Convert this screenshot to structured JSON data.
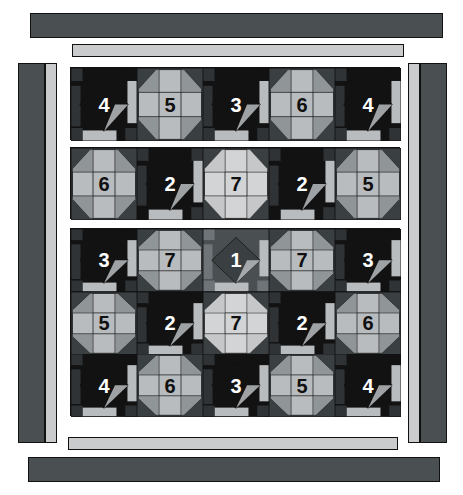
{
  "image": {
    "kind": "quilt-pattern-diagram",
    "width": 463,
    "height": 495,
    "background": "#ffffff"
  },
  "palette": {
    "dark_navy": "#2f3336",
    "black": "#121212",
    "charcoal": "#3a3f42",
    "mid_gray": "#6f7478",
    "light_gray": "#b9bcbe",
    "pale_gray": "#d2d4d5",
    "white_ish": "#e9eaea",
    "outline": "#111111",
    "number_light": "#ffffff",
    "number_dark": "#101010"
  },
  "borders": {
    "top_outer": {
      "name": "top-outer-border-bar",
      "x": 30,
      "y": 13,
      "w": 413,
      "h": 25,
      "fill": "#4a4f52"
    },
    "top_inner": {
      "name": "top-inner-border-bar",
      "x": 72,
      "y": 44,
      "w": 332,
      "h": 13,
      "fill": "#c9cbcc"
    },
    "bottom_inner": {
      "name": "bottom-inner-border-bar",
      "x": 68,
      "y": 437,
      "w": 330,
      "h": 13,
      "fill": "#c9cbcc"
    },
    "bottom_outer": {
      "name": "bottom-outer-border-bar",
      "x": 28,
      "y": 457,
      "w": 412,
      "h": 25,
      "fill": "#4a4f52"
    },
    "left_outer": {
      "name": "left-outer-border-bar",
      "x": 18,
      "y": 63,
      "w": 27,
      "h": 380,
      "fill": "#4a4f52"
    },
    "left_inner": {
      "name": "left-inner-border-bar",
      "x": 45,
      "y": 63,
      "w": 12,
      "h": 380,
      "fill": "#c9cbcc"
    },
    "right_inner": {
      "name": "right-inner-border-bar",
      "x": 408,
      "y": 63,
      "w": 12,
      "h": 380,
      "fill": "#c9cbcc"
    },
    "right_outer": {
      "name": "right-outer-border-bar",
      "x": 420,
      "y": 63,
      "w": 27,
      "h": 380,
      "fill": "#4a4f52"
    }
  },
  "panel": {
    "x": 68,
    "y": 63,
    "w": 334,
    "h": 370
  },
  "sections": [
    {
      "name": "quilt-section-top",
      "x": 70,
      "y": 67,
      "w": 330,
      "h": 73,
      "cols": 5,
      "rows": 1
    },
    {
      "name": "quilt-section-middle",
      "x": 70,
      "y": 147,
      "w": 330,
      "h": 72,
      "cols": 5,
      "rows": 1
    },
    {
      "name": "quilt-section-bottom",
      "x": 70,
      "y": 228,
      "w": 330,
      "h": 188,
      "cols": 5,
      "rows": 3
    }
  ],
  "blocks": {
    "section_top": [
      {
        "label": "4",
        "style": "snowball-dark",
        "bg": "#121212",
        "center": "#121212",
        "ring": "#2f3336",
        "accent": "#b9bcbe",
        "num_color": "#ffffff"
      },
      {
        "label": "5",
        "style": "octagon-light",
        "bg": "#3a3f42",
        "center": "#b9bcbe",
        "ring": "#b9bcbe",
        "accent": "#6f7478",
        "num_color": "#101010"
      },
      {
        "label": "3",
        "style": "snowball-dark",
        "bg": "#121212",
        "center": "#121212",
        "ring": "#2f3336",
        "accent": "#b9bcbe",
        "num_color": "#ffffff"
      },
      {
        "label": "6",
        "style": "octagon-light",
        "bg": "#3a3f42",
        "center": "#b9bcbe",
        "ring": "#b9bcbe",
        "accent": "#6f7478",
        "num_color": "#101010"
      },
      {
        "label": "4",
        "style": "snowball-dark",
        "bg": "#121212",
        "center": "#121212",
        "ring": "#2f3336",
        "accent": "#b9bcbe",
        "num_color": "#ffffff"
      }
    ],
    "section_middle": [
      {
        "label": "6",
        "style": "octagon-light",
        "bg": "#3a3f42",
        "center": "#b9bcbe",
        "ring": "#b9bcbe",
        "accent": "#6f7478",
        "num_color": "#101010"
      },
      {
        "label": "2",
        "style": "snowball-dark",
        "bg": "#121212",
        "center": "#121212",
        "ring": "#2f3336",
        "accent": "#b9bcbe",
        "num_color": "#ffffff"
      },
      {
        "label": "7",
        "style": "octagon-light",
        "bg": "#3a3f42",
        "center": "#d2d4d5",
        "ring": "#d2d4d5",
        "accent": "#b9bcbe",
        "num_color": "#101010"
      },
      {
        "label": "2",
        "style": "snowball-dark",
        "bg": "#121212",
        "center": "#121212",
        "ring": "#2f3336",
        "accent": "#b9bcbe",
        "num_color": "#ffffff"
      },
      {
        "label": "5",
        "style": "octagon-light",
        "bg": "#3a3f42",
        "center": "#b9bcbe",
        "ring": "#b9bcbe",
        "accent": "#6f7478",
        "num_color": "#101010"
      }
    ],
    "section_bottom": [
      {
        "label": "3",
        "style": "snowball-dark",
        "bg": "#121212",
        "center": "#121212",
        "ring": "#2f3336",
        "accent": "#b9bcbe",
        "num_color": "#ffffff"
      },
      {
        "label": "7",
        "style": "octagon-light",
        "bg": "#3a3f42",
        "center": "#b9bcbe",
        "ring": "#b9bcbe",
        "accent": "#6f7478",
        "num_color": "#101010"
      },
      {
        "label": "1",
        "style": "snowball-mid",
        "bg": "#4a4f52",
        "center": "#3a3f42",
        "ring": "#6f7478",
        "accent": "#b9bcbe",
        "num_color": "#ffffff"
      },
      {
        "label": "7",
        "style": "octagon-light",
        "bg": "#3a3f42",
        "center": "#b9bcbe",
        "ring": "#b9bcbe",
        "accent": "#6f7478",
        "num_color": "#101010"
      },
      {
        "label": "3",
        "style": "snowball-dark",
        "bg": "#121212",
        "center": "#121212",
        "ring": "#2f3336",
        "accent": "#b9bcbe",
        "num_color": "#ffffff"
      },
      {
        "label": "5",
        "style": "octagon-light",
        "bg": "#3a3f42",
        "center": "#b9bcbe",
        "ring": "#b9bcbe",
        "accent": "#6f7478",
        "num_color": "#101010"
      },
      {
        "label": "2",
        "style": "snowball-dark",
        "bg": "#121212",
        "center": "#121212",
        "ring": "#2f3336",
        "accent": "#b9bcbe",
        "num_color": "#ffffff"
      },
      {
        "label": "7",
        "style": "octagon-light",
        "bg": "#3a3f42",
        "center": "#d2d4d5",
        "ring": "#d2d4d5",
        "accent": "#b9bcbe",
        "num_color": "#101010"
      },
      {
        "label": "2",
        "style": "snowball-dark",
        "bg": "#121212",
        "center": "#121212",
        "ring": "#2f3336",
        "accent": "#b9bcbe",
        "num_color": "#ffffff"
      },
      {
        "label": "6",
        "style": "octagon-light",
        "bg": "#3a3f42",
        "center": "#b9bcbe",
        "ring": "#b9bcbe",
        "accent": "#6f7478",
        "num_color": "#101010"
      },
      {
        "label": "4",
        "style": "snowball-dark",
        "bg": "#121212",
        "center": "#121212",
        "ring": "#2f3336",
        "accent": "#b9bcbe",
        "num_color": "#ffffff"
      },
      {
        "label": "6",
        "style": "octagon-light",
        "bg": "#3a3f42",
        "center": "#b9bcbe",
        "ring": "#b9bcbe",
        "accent": "#6f7478",
        "num_color": "#101010"
      },
      {
        "label": "3",
        "style": "snowball-dark",
        "bg": "#121212",
        "center": "#121212",
        "ring": "#2f3336",
        "accent": "#b9bcbe",
        "num_color": "#ffffff"
      },
      {
        "label": "5",
        "style": "octagon-light",
        "bg": "#3a3f42",
        "center": "#b9bcbe",
        "ring": "#b9bcbe",
        "accent": "#6f7478",
        "num_color": "#101010"
      },
      {
        "label": "4",
        "style": "snowball-dark",
        "bg": "#121212",
        "center": "#121212",
        "ring": "#2f3336",
        "accent": "#b9bcbe",
        "num_color": "#ffffff"
      }
    ]
  },
  "legend_numbers": [
    "1",
    "2",
    "3",
    "4",
    "5",
    "6",
    "7"
  ]
}
